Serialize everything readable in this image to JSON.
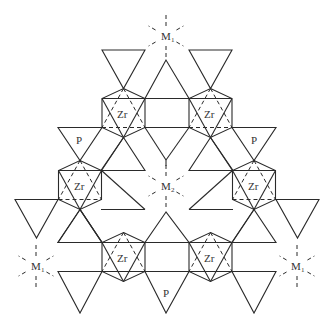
{
  "labels": {
    "zr": "Zr",
    "p": "P",
    "m_base": "M",
    "m1_sub": "1",
    "m2_sub": "2"
  },
  "legend": {
    "hexagon": "ZrO6 octahedron",
    "triangle": "PO4 tetrahedron",
    "dashed_star": "cation coordination site"
  },
  "counts": {
    "zr_octahedra": 6,
    "p_labels": 3,
    "m1_sites": 3,
    "m2_sites": 1
  }
}
